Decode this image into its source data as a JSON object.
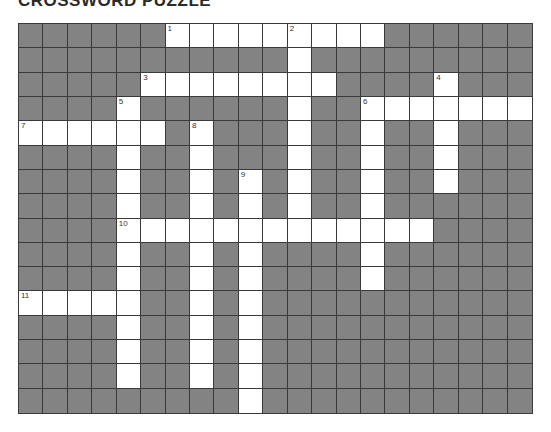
{
  "title": "CROSSWORD PUZZLE",
  "grid": {
    "cols": 21,
    "rows": 16,
    "colors": {
      "block": "#838383",
      "open": "#ffffff",
      "line": "#3a3a3a"
    }
  },
  "entries": [
    {
      "number": "1",
      "direction": "across",
      "row": 0,
      "col": 6,
      "length": 9
    },
    {
      "number": "2",
      "direction": "down",
      "row": 0,
      "col": 11,
      "length": 9
    },
    {
      "number": "3",
      "direction": "across",
      "row": 2,
      "col": 5,
      "length": 8
    },
    {
      "number": "4",
      "direction": "down",
      "row": 2,
      "col": 17,
      "length": 5
    },
    {
      "number": "5",
      "direction": "down",
      "row": 3,
      "col": 4,
      "length": 12
    },
    {
      "number": "6",
      "direction": "across",
      "row": 3,
      "col": 14,
      "length": 7
    },
    {
      "number": "6",
      "direction": "down",
      "row": 3,
      "col": 14,
      "length": 8
    },
    {
      "number": "7",
      "direction": "across",
      "row": 4,
      "col": 0,
      "length": 6
    },
    {
      "number": "8",
      "direction": "down",
      "row": 4,
      "col": 7,
      "length": 11
    },
    {
      "number": "9",
      "direction": "down",
      "row": 6,
      "col": 9,
      "length": 10
    },
    {
      "number": "10",
      "direction": "across",
      "row": 8,
      "col": 4,
      "length": 13
    },
    {
      "number": "11",
      "direction": "across",
      "row": 11,
      "col": 0,
      "length": 5
    }
  ]
}
